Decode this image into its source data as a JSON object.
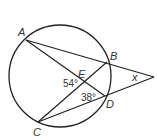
{
  "diagram": {
    "type": "circle-secants",
    "points": {
      "A": {
        "label": "A",
        "x": 26,
        "y": 40
      },
      "B": {
        "label": "B",
        "x": 107,
        "y": 62
      },
      "C": {
        "label": "C",
        "x": 38,
        "y": 122
      },
      "D": {
        "label": "D",
        "x": 105,
        "y": 96
      },
      "E": {
        "label": "E",
        "x": 83,
        "y": 82
      },
      "P": {
        "label": "",
        "x": 154,
        "y": 77
      }
    },
    "angles": {
      "angle_E": "54°",
      "angle_D": "38°",
      "angle_x": "x"
    },
    "circle": {
      "cx": 60,
      "cy": 76,
      "r": 51
    }
  }
}
